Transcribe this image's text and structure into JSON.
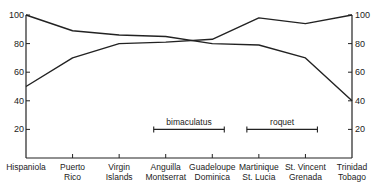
{
  "chart_data": {
    "type": "line",
    "title": "",
    "xlabel": "",
    "ylabel": "",
    "ylim": [
      0,
      100
    ],
    "yticks": [
      20,
      40,
      60,
      80,
      100
    ],
    "ytick_labels": [
      "20",
      "40",
      "60",
      "80",
      "100"
    ],
    "grid": false,
    "right_axis": true,
    "categories": [
      {
        "line1": "Hispaniola",
        "line2": ""
      },
      {
        "line1": "Puerto",
        "line2": "Rico"
      },
      {
        "line1": "Virgin",
        "line2": "Islands"
      },
      {
        "line1": "Anguilla",
        "line2": "Montserrat"
      },
      {
        "line1": "Guadeloupe",
        "line2": "Dominica"
      },
      {
        "line1": "Martinique",
        "line2": "St. Lucia"
      },
      {
        "line1": "St. Vincent",
        "line2": "Grenada"
      },
      {
        "line1": "Trinidad",
        "line2": "Tobago"
      }
    ],
    "series": [
      {
        "name": "series-decreasing",
        "values": [
          100,
          89,
          86,
          85,
          80,
          79,
          70,
          40
        ]
      },
      {
        "name": "series-increasing",
        "values": [
          50,
          70,
          80,
          81,
          83,
          98,
          94,
          100
        ]
      }
    ],
    "annotations": [
      {
        "label": "bimaculatus",
        "y": 20,
        "from_category": 3,
        "to_category": 4
      },
      {
        "label": "roquet",
        "y": 20,
        "from_category": 5,
        "to_category": 6
      }
    ]
  }
}
